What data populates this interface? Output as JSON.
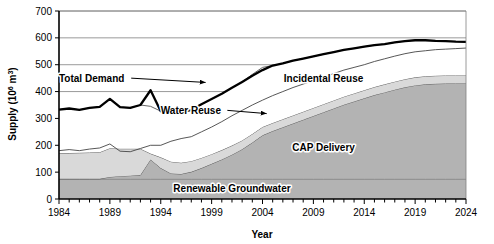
{
  "chart_data": {
    "type": "area",
    "stacked": true,
    "title": "",
    "xlabel": "Year",
    "ylabel": "Supply (10⁶ m³)",
    "ylabel_parts": {
      "base": "Supply (10",
      "exponent": "6",
      "tail": " m",
      "exponent2": "3",
      "close": ")"
    },
    "xlim": [
      1984,
      2024
    ],
    "ylim": [
      0,
      700
    ],
    "yticks": [
      0,
      100,
      200,
      300,
      400,
      500,
      600,
      700
    ],
    "xticks": [
      1984,
      1989,
      1994,
      1999,
      2004,
      2009,
      2014,
      2019,
      2024
    ],
    "xtick_interval_minor": 1,
    "grid": "horizontal",
    "legend_position": "inline-annotations",
    "colors": {
      "renewable_groundwater": "#b3b3b3",
      "cap_delivery": "#b3b3b3",
      "water_reuse": "#d9d9d9",
      "incidental_reuse": "#ffffff",
      "total_demand_line": "#000000",
      "gridline": "#808080",
      "axis": "#000000"
    },
    "x": [
      1984,
      1985,
      1986,
      1987,
      1988,
      1989,
      1990,
      1991,
      1992,
      1993,
      1994,
      1995,
      1996,
      1997,
      1998,
      1999,
      2000,
      2001,
      2002,
      2003,
      2004,
      2005,
      2006,
      2007,
      2008,
      2009,
      2010,
      2011,
      2012,
      2013,
      2014,
      2015,
      2016,
      2017,
      2018,
      2019,
      2020,
      2021,
      2022,
      2023,
      2024
    ],
    "series": [
      {
        "name": "Renewable Groundwater",
        "label": "Renewable Groundwater",
        "fill": "#b3b3b3",
        "values": [
          75,
          75,
          75,
          75,
          75,
          75,
          75,
          75,
          75,
          75,
          75,
          75,
          75,
          75,
          75,
          75,
          75,
          75,
          75,
          75,
          75,
          75,
          75,
          75,
          75,
          75,
          75,
          75,
          75,
          75,
          75,
          75,
          75,
          75,
          75,
          75,
          75,
          75,
          75,
          75,
          75
        ]
      },
      {
        "name": "CAP Delivery",
        "label": "CAP Delivery",
        "fill": "#b3b3b3",
        "values": [
          0,
          0,
          0,
          0,
          0,
          7,
          10,
          12,
          14,
          72,
          40,
          20,
          18,
          26,
          40,
          56,
          72,
          90,
          110,
          135,
          162,
          178,
          192,
          206,
          220,
          234,
          248,
          262,
          276,
          288,
          300,
          312,
          322,
          332,
          341,
          348,
          352,
          354,
          355,
          355,
          355
        ]
      },
      {
        "name": "Water Reuse",
        "label": "Water Reuse",
        "fill": "#d9d9d9",
        "values": [
          95,
          96,
          97,
          98,
          99,
          107,
          102,
          100,
          98,
          22,
          40,
          44,
          42,
          40,
          38,
          36,
          35,
          34,
          33,
          32,
          31,
          30,
          30,
          30,
          30,
          30,
          30,
          30,
          30,
          30,
          30,
          30,
          30,
          30,
          30,
          30,
          30,
          30,
          30,
          30,
          30
        ]
      },
      {
        "name": "Incidental Reuse",
        "label": "Incidental Reuse",
        "fill": "#ffffff",
        "values": [
          163,
          166,
          160,
          166,
          169,
          184,
          155,
          152,
          163,
          176,
          172,
          183,
          190,
          190,
          200,
          205,
          210,
          215,
          218,
          222,
          222,
          214,
          208,
          204,
          198,
          192,
          186,
          180,
          174,
          168,
          162,
          156,
          150,
          146,
          142,
          138,
          134,
          130,
          128,
          126,
          125
        ]
      }
    ],
    "total_demand": {
      "name": "Total Demand",
      "label": "Total Demand",
      "values": [
        333,
        337,
        332,
        339,
        343,
        373,
        342,
        339,
        350,
        405,
        327,
        322,
        325,
        331,
        353,
        372,
        392,
        414,
        436,
        459,
        480,
        497,
        505,
        515,
        523,
        531,
        539,
        547,
        555,
        561,
        567,
        573,
        577,
        583,
        588,
        591,
        591,
        589,
        588,
        586,
        585
      ]
    },
    "upper_boundary": {
      "name": "Upper supply capacity",
      "values": [
        180,
        184,
        180,
        186,
        190,
        205,
        178,
        176,
        188,
        200,
        200,
        215,
        225,
        232,
        250,
        268,
        288,
        310,
        330,
        350,
        368,
        385,
        400,
        415,
        428,
        441,
        454,
        467,
        480,
        490,
        500,
        512,
        522,
        532,
        541,
        548,
        552,
        556,
        558,
        560,
        562
      ]
    },
    "annotations": [
      {
        "name": "total-demand-annotation",
        "text": "Total Demand",
        "x": 1984,
        "y": 450,
        "leader_to_x": 1999,
        "leader_to_y": 434
      },
      {
        "name": "water-reuse-annotation",
        "text": "Water Reuse",
        "x": 1994,
        "y": 330,
        "leader_to_x": 2005,
        "leader_to_y": 318
      },
      {
        "name": "incidental-reuse-annotation",
        "text": "Incidental Reuse",
        "x": 2010,
        "y": 450
      },
      {
        "name": "cap-delivery-annotation",
        "text": "CAP Delivery",
        "x": 2010,
        "y": 190
      },
      {
        "name": "renewable-groundwater-annotation",
        "text": "Renewable Groundwater",
        "x": 2001,
        "y": 38
      }
    ]
  }
}
